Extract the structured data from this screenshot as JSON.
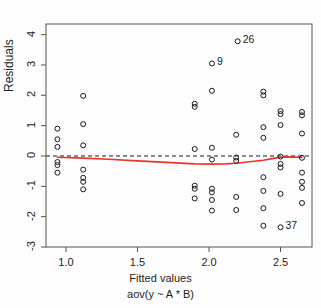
{
  "figure": {
    "kind": "residuals-vs-fitted",
    "ylabel": "Residuals",
    "xlabel_line1": "Fitted values",
    "xlabel_line2": "aov(y ~ A * B)",
    "background": "#fdfdfd",
    "point_color": "#1a1a1a",
    "zero_line_color": "#1a1a1a",
    "smoother_color": "#e8342a"
  },
  "chart_data": {
    "type": "scatter",
    "title": "",
    "xlabel": "Fitted values\naov(y ~ A * B)",
    "ylabel": "Residuals",
    "xlim": [
      0.86,
      2.72
    ],
    "ylim": [
      -3.0,
      4.35
    ],
    "xticks": [
      1.0,
      1.5,
      2.0,
      2.5
    ],
    "xticklabels": [
      "1.0",
      "1.5",
      "2.0",
      "2.5"
    ],
    "yticks": [
      4,
      3,
      2,
      1,
      0,
      -1,
      -2,
      -3
    ],
    "yticklabels": [
      "4",
      "3",
      "2",
      "1",
      "0",
      "-1",
      "-2",
      "-3"
    ],
    "grid": false,
    "legend": null,
    "zero_reference_line": {
      "y": 0,
      "style": "dashed",
      "color": "#1a1a1a"
    },
    "lowess_smoother": {
      "color": "#e8342a",
      "x": [
        0.94,
        1.12,
        1.3,
        1.5,
        1.7,
        1.9,
        2.02,
        2.12,
        2.19,
        2.3,
        2.38,
        2.46,
        2.5,
        2.58,
        2.65
      ],
      "y": [
        -0.04,
        -0.07,
        -0.11,
        -0.16,
        -0.21,
        -0.26,
        -0.27,
        -0.26,
        -0.24,
        -0.18,
        -0.14,
        -0.07,
        -0.04,
        -0.03,
        -0.05
      ]
    },
    "points": [
      {
        "x": 0.94,
        "y": 0.9
      },
      {
        "x": 0.94,
        "y": 0.55
      },
      {
        "x": 0.94,
        "y": 0.3
      },
      {
        "x": 0.94,
        "y": -0.2
      },
      {
        "x": 0.94,
        "y": -0.3
      },
      {
        "x": 0.94,
        "y": -0.55
      },
      {
        "x": 1.12,
        "y": 1.98
      },
      {
        "x": 1.12,
        "y": 1.05
      },
      {
        "x": 1.12,
        "y": 0.35
      },
      {
        "x": 1.12,
        "y": -0.45
      },
      {
        "x": 1.12,
        "y": -0.72
      },
      {
        "x": 1.12,
        "y": -0.85
      },
      {
        "x": 1.12,
        "y": -1.1
      },
      {
        "x": 1.9,
        "y": 1.72
      },
      {
        "x": 1.9,
        "y": 1.62
      },
      {
        "x": 1.9,
        "y": 0.23
      },
      {
        "x": 1.9,
        "y": -0.98
      },
      {
        "x": 1.9,
        "y": -1.08
      },
      {
        "x": 1.9,
        "y": -1.4
      },
      {
        "x": 2.02,
        "y": 3.05
      },
      {
        "x": 2.02,
        "y": 2.15
      },
      {
        "x": 2.02,
        "y": 0.27
      },
      {
        "x": 2.02,
        "y": -0.12
      },
      {
        "x": 2.02,
        "y": -1.08
      },
      {
        "x": 2.02,
        "y": -1.2
      },
      {
        "x": 2.02,
        "y": -1.45
      },
      {
        "x": 2.02,
        "y": -1.8
      },
      {
        "x": 2.19,
        "y": 0.7
      },
      {
        "x": 2.19,
        "y": -0.05
      },
      {
        "x": 2.19,
        "y": -0.16
      },
      {
        "x": 2.19,
        "y": -1.35
      },
      {
        "x": 2.19,
        "y": -1.78
      },
      {
        "x": 2.38,
        "y": 2.12
      },
      {
        "x": 2.38,
        "y": 2.0
      },
      {
        "x": 2.38,
        "y": 0.95
      },
      {
        "x": 2.38,
        "y": 0.6
      },
      {
        "x": 2.38,
        "y": -0.7
      },
      {
        "x": 2.38,
        "y": -1.15
      },
      {
        "x": 2.38,
        "y": -1.72
      },
      {
        "x": 2.38,
        "y": -2.3
      },
      {
        "x": 2.5,
        "y": 1.48
      },
      {
        "x": 2.5,
        "y": 1.38
      },
      {
        "x": 2.5,
        "y": 1.02
      },
      {
        "x": 2.5,
        "y": -0.02
      },
      {
        "x": 2.5,
        "y": -0.26
      },
      {
        "x": 2.5,
        "y": -0.38
      },
      {
        "x": 2.5,
        "y": -1.25
      },
      {
        "x": 2.65,
        "y": 1.45
      },
      {
        "x": 2.65,
        "y": 1.34
      },
      {
        "x": 2.65,
        "y": 0.74
      },
      {
        "x": 2.65,
        "y": -0.06
      },
      {
        "x": 2.65,
        "y": -0.55
      },
      {
        "x": 2.65,
        "y": -0.85
      },
      {
        "x": 2.65,
        "y": -1.05
      },
      {
        "x": 2.65,
        "y": -1.55
      },
      {
        "x": 2.2,
        "y": 3.78,
        "label": "26"
      },
      {
        "x": 2.5,
        "y": -2.35,
        "label": "37"
      }
    ],
    "outlier_labels": [
      {
        "id": "26",
        "x": 2.2,
        "y": 3.78
      },
      {
        "id": "9",
        "x": 2.02,
        "y": 3.05
      },
      {
        "id": "37",
        "x": 2.5,
        "y": -2.35
      }
    ]
  }
}
